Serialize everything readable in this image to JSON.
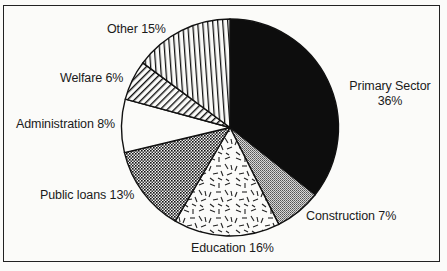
{
  "chart_data": {
    "type": "pie",
    "title": "",
    "categories": [
      "Primary Sector",
      "Construction",
      "Education",
      "Public loans",
      "Administration",
      "Welfare",
      "Other"
    ],
    "values": [
      36,
      7,
      16,
      13,
      8,
      6,
      15
    ],
    "unit": "%",
    "start_angle_deg": 0,
    "direction": "clockwise",
    "legend": "none (direct labels)",
    "slices": [
      {
        "name": "Primary Sector",
        "value": 36,
        "pattern": "solid-black"
      },
      {
        "name": "Construction",
        "value": 7,
        "pattern": "fine-grey-dots"
      },
      {
        "name": "Education",
        "value": 16,
        "pattern": "scattered-dashes"
      },
      {
        "name": "Public loans",
        "value": 13,
        "pattern": "dense-checker"
      },
      {
        "name": "Administration",
        "value": 8,
        "pattern": "white"
      },
      {
        "name": "Welfare",
        "value": 6,
        "pattern": "diagonal-hatch"
      },
      {
        "name": "Other",
        "value": 15,
        "pattern": "vertical-lines"
      }
    ]
  },
  "labels": {
    "primary_line1": "Primary Sector",
    "primary_line2": "36%",
    "construction": "Construction 7%",
    "education": "Education 16%",
    "public_loans": "Public loans 13%",
    "administration": "Administration 8%",
    "welfare": "Welfare 6%",
    "other": "Other 15%"
  },
  "colors": {
    "background": "#fbfbf9",
    "ink": "#111111",
    "construction_grey": "#9a9a9a"
  }
}
